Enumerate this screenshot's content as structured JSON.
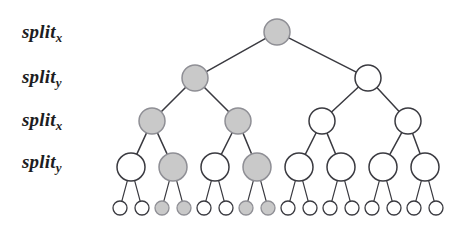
{
  "figure": {
    "background_color": "#ffffff",
    "stroke_color": "#3a3a40",
    "node_fill_highlight": "#c9c9c9",
    "node_fill_empty": "#ffffff"
  },
  "labels": [
    {
      "name": "split-x-level-1",
      "text": "split",
      "sub": "x",
      "x": 22,
      "y": 22
    },
    {
      "name": "split-y-level-2",
      "text": "split",
      "sub": "y",
      "x": 22,
      "y": 67
    },
    {
      "name": "split-x-level-3",
      "text": "split",
      "sub": "x",
      "x": 22,
      "y": 110
    },
    {
      "name": "split-y-level-4",
      "text": "split",
      "sub": "y",
      "x": 22,
      "y": 152
    }
  ],
  "tree": {
    "levels": [
      {
        "name": "level-1-root",
        "label_ref": "split_x",
        "cy": 32,
        "r": 13,
        "nodes": [
          {
            "id": "n0",
            "cx": 277,
            "filled": true
          }
        ]
      },
      {
        "name": "level-2",
        "label_ref": "split_y",
        "cy": 78,
        "r": 13,
        "nodes": [
          {
            "id": "n1",
            "cx": 195,
            "filled": true
          },
          {
            "id": "n2",
            "cx": 368,
            "filled": false
          }
        ]
      },
      {
        "name": "level-3",
        "label_ref": "split_x",
        "cy": 121,
        "r": 13,
        "nodes": [
          {
            "id": "n3",
            "cx": 152,
            "filled": true
          },
          {
            "id": "n4",
            "cx": 238,
            "filled": true
          },
          {
            "id": "n5",
            "cx": 322,
            "filled": false
          },
          {
            "id": "n6",
            "cx": 408,
            "filled": false
          }
        ]
      },
      {
        "name": "level-4",
        "label_ref": "split_y",
        "cy": 167,
        "r": 14,
        "nodes": [
          {
            "id": "n7",
            "cx": 131,
            "filled": false
          },
          {
            "id": "n8",
            "cx": 173,
            "filled": true
          },
          {
            "id": "n9",
            "cx": 215,
            "filled": false
          },
          {
            "id": "n10",
            "cx": 257,
            "filled": true
          },
          {
            "id": "n11",
            "cx": 299,
            "filled": false
          },
          {
            "id": "n12",
            "cx": 341,
            "filled": false
          },
          {
            "id": "n13",
            "cx": 383,
            "filled": false
          },
          {
            "id": "n14",
            "cx": 425,
            "filled": false
          }
        ]
      },
      {
        "name": "level-5-leaves",
        "label_ref": "",
        "cy": 208,
        "r": 7,
        "nodes": [
          {
            "id": "l0",
            "cx": 120,
            "filled": false
          },
          {
            "id": "l1",
            "cx": 142,
            "filled": false
          },
          {
            "id": "l2",
            "cx": 162,
            "filled": true
          },
          {
            "id": "l3",
            "cx": 184,
            "filled": true
          },
          {
            "id": "l4",
            "cx": 204,
            "filled": false
          },
          {
            "id": "l5",
            "cx": 226,
            "filled": false
          },
          {
            "id": "l6",
            "cx": 246,
            "filled": true
          },
          {
            "id": "l7",
            "cx": 268,
            "filled": true
          },
          {
            "id": "l8",
            "cx": 288,
            "filled": false
          },
          {
            "id": "l9",
            "cx": 310,
            "filled": false
          },
          {
            "id": "l10",
            "cx": 330,
            "filled": false
          },
          {
            "id": "l11",
            "cx": 352,
            "filled": false
          },
          {
            "id": "l12",
            "cx": 372,
            "filled": false
          },
          {
            "id": "l13",
            "cx": 394,
            "filled": false
          },
          {
            "id": "l14",
            "cx": 414,
            "filled": false
          },
          {
            "id": "l15",
            "cx": 436,
            "filled": false
          }
        ]
      }
    ],
    "edges": [
      {
        "from": "n0",
        "to": "n1"
      },
      {
        "from": "n0",
        "to": "n2"
      },
      {
        "from": "n1",
        "to": "n3"
      },
      {
        "from": "n1",
        "to": "n4"
      },
      {
        "from": "n2",
        "to": "n5"
      },
      {
        "from": "n2",
        "to": "n6"
      },
      {
        "from": "n3",
        "to": "n7"
      },
      {
        "from": "n3",
        "to": "n8"
      },
      {
        "from": "n4",
        "to": "n9"
      },
      {
        "from": "n4",
        "to": "n10"
      },
      {
        "from": "n5",
        "to": "n11"
      },
      {
        "from": "n5",
        "to": "n12"
      },
      {
        "from": "n6",
        "to": "n13"
      },
      {
        "from": "n6",
        "to": "n14"
      },
      {
        "from": "n7",
        "to": "l0"
      },
      {
        "from": "n7",
        "to": "l1"
      },
      {
        "from": "n8",
        "to": "l2"
      },
      {
        "from": "n8",
        "to": "l3"
      },
      {
        "from": "n9",
        "to": "l4"
      },
      {
        "from": "n9",
        "to": "l5"
      },
      {
        "from": "n10",
        "to": "l6"
      },
      {
        "from": "n10",
        "to": "l7"
      },
      {
        "from": "n11",
        "to": "l8"
      },
      {
        "from": "n11",
        "to": "l9"
      },
      {
        "from": "n12",
        "to": "l10"
      },
      {
        "from": "n12",
        "to": "l11"
      },
      {
        "from": "n13",
        "to": "l12"
      },
      {
        "from": "n13",
        "to": "l13"
      },
      {
        "from": "n14",
        "to": "l14"
      },
      {
        "from": "n14",
        "to": "l15"
      }
    ]
  }
}
